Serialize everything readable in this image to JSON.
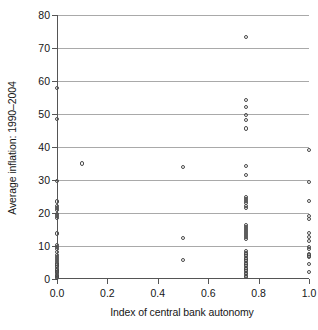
{
  "chart_data": {
    "type": "scatter",
    "title": "",
    "xlabel": "Index of central bank autonomy",
    "ylabel": "Average inflation: 1990–2004",
    "xlim": [
      0.0,
      1.0
    ],
    "ylim": [
      0,
      80
    ],
    "xticks": [
      "0.0",
      "0.2",
      "0.4",
      "0.6",
      "0.8",
      "1.0"
    ],
    "xtick_values": [
      0.0,
      0.2,
      0.4,
      0.6,
      0.8,
      1.0
    ],
    "yticks": [
      "0",
      "10",
      "20",
      "30",
      "40",
      "50",
      "60",
      "70",
      "80"
    ],
    "ytick_values": [
      0,
      10,
      20,
      30,
      40,
      50,
      60,
      70,
      80
    ],
    "grid": "horizontal",
    "legend": "none",
    "marker": "open-circle",
    "marker_color": "#4a4a4a",
    "grid_color": "#a9a9a9",
    "axis_color": "#555555",
    "background": "#ffffff",
    "points": [
      [
        0.0,
        58.0
      ],
      [
        0.0,
        48.5
      ],
      [
        0.0,
        29.7
      ],
      [
        0.0,
        23.5
      ],
      [
        0.0,
        22.2
      ],
      [
        0.0,
        21.6
      ],
      [
        0.0,
        21.0
      ],
      [
        0.0,
        19.6
      ],
      [
        0.0,
        19.0
      ],
      [
        0.0,
        18.4
      ],
      [
        0.0,
        13.8
      ],
      [
        0.0,
        10.3
      ],
      [
        0.0,
        9.7
      ],
      [
        0.0,
        9.0
      ],
      [
        0.0,
        8.2
      ],
      [
        0.0,
        7.3
      ],
      [
        0.0,
        6.6
      ],
      [
        0.0,
        6.0
      ],
      [
        0.0,
        5.4
      ],
      [
        0.0,
        4.7
      ],
      [
        0.0,
        4.1
      ],
      [
        0.0,
        3.6
      ],
      [
        0.0,
        3.1
      ],
      [
        0.0,
        2.6
      ],
      [
        0.0,
        2.1
      ],
      [
        0.0,
        1.7
      ],
      [
        0.0,
        1.3
      ],
      [
        0.0,
        0.9
      ],
      [
        0.0,
        0.5
      ],
      [
        0.0,
        0.2
      ],
      [
        0.1,
        35.0
      ],
      [
        0.5,
        34.0
      ],
      [
        0.5,
        12.5
      ],
      [
        0.5,
        5.7
      ],
      [
        0.75,
        73.4
      ],
      [
        0.75,
        54.3
      ],
      [
        0.75,
        52.2
      ],
      [
        0.75,
        49.6
      ],
      [
        0.75,
        48.2
      ],
      [
        0.75,
        45.6
      ],
      [
        0.75,
        34.3
      ],
      [
        0.75,
        31.4
      ],
      [
        0.75,
        24.8
      ],
      [
        0.75,
        24.2
      ],
      [
        0.75,
        23.6
      ],
      [
        0.75,
        23.0
      ],
      [
        0.75,
        22.2
      ],
      [
        0.75,
        21.4
      ],
      [
        0.75,
        16.3
      ],
      [
        0.75,
        15.7
      ],
      [
        0.75,
        15.1
      ],
      [
        0.75,
        14.5
      ],
      [
        0.75,
        13.9
      ],
      [
        0.75,
        13.3
      ],
      [
        0.75,
        12.7
      ],
      [
        0.75,
        12.0
      ],
      [
        0.75,
        8.5
      ],
      [
        0.75,
        8.0
      ],
      [
        0.75,
        7.4
      ],
      [
        0.75,
        6.9
      ],
      [
        0.75,
        6.4
      ],
      [
        0.75,
        5.9
      ],
      [
        0.75,
        5.4
      ],
      [
        0.75,
        4.9
      ],
      [
        0.75,
        4.4
      ],
      [
        0.75,
        3.9
      ],
      [
        0.75,
        3.4
      ],
      [
        0.75,
        2.9
      ],
      [
        0.75,
        2.4
      ],
      [
        0.75,
        1.9
      ],
      [
        0.75,
        1.4
      ],
      [
        0.75,
        0.9
      ],
      [
        0.75,
        0.5
      ],
      [
        1.0,
        39.0
      ],
      [
        1.0,
        29.4
      ],
      [
        1.0,
        23.6
      ],
      [
        1.0,
        19.1
      ],
      [
        1.0,
        18.2
      ],
      [
        1.0,
        14.0
      ],
      [
        1.0,
        12.7
      ],
      [
        1.0,
        11.5
      ],
      [
        1.0,
        9.6
      ],
      [
        1.0,
        9.1
      ],
      [
        1.0,
        7.6
      ],
      [
        1.0,
        7.1
      ],
      [
        1.0,
        6.7
      ],
      [
        1.0,
        4.6
      ],
      [
        1.0,
        2.1
      ]
    ]
  }
}
